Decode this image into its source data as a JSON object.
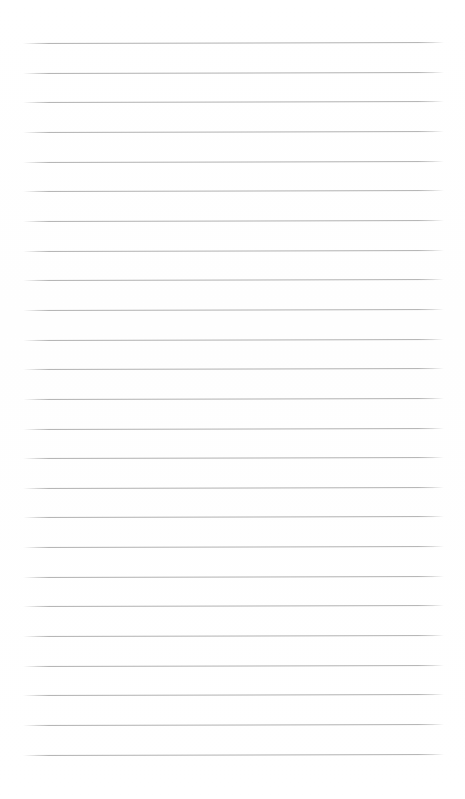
{
  "document": {
    "type": "ruled-notebook-page",
    "title": "Blank Ruled Notebook Page",
    "content_text": "",
    "page_width_px": 465,
    "page_height_px": 799,
    "background_color": "#ffffff",
    "has_text": false,
    "has_images": false,
    "has_handwriting": false
  },
  "ruling": {
    "line_color": "#b2b2b2",
    "line_thickness_px": 1,
    "line_count": 25,
    "line_spacing_px": 29.65,
    "first_line_y_px": 43,
    "last_line_y_px": 755,
    "line_start_x_px": 23,
    "line_end_x_px": 444,
    "line_length_px": 421,
    "slant_deg": -0.12,
    "style": "horizontal-rules-only",
    "has_vertical_margin_rule": false,
    "lines": [
      {
        "index": 1,
        "y": 43.0,
        "x_start": 23,
        "x_end": 444
      },
      {
        "index": 2,
        "y": 72.7,
        "x_start": 23,
        "x_end": 444
      },
      {
        "index": 3,
        "y": 102.3,
        "x_start": 23,
        "x_end": 444
      },
      {
        "index": 4,
        "y": 132.0,
        "x_start": 23,
        "x_end": 444
      },
      {
        "index": 5,
        "y": 161.6,
        "x_start": 23,
        "x_end": 444
      },
      {
        "index": 6,
        "y": 191.3,
        "x_start": 23,
        "x_end": 444
      },
      {
        "index": 7,
        "y": 220.9,
        "x_start": 23,
        "x_end": 444
      },
      {
        "index": 8,
        "y": 250.6,
        "x_start": 23,
        "x_end": 444
      },
      {
        "index": 9,
        "y": 280.2,
        "x_start": 23,
        "x_end": 444
      },
      {
        "index": 10,
        "y": 309.9,
        "x_start": 23,
        "x_end": 444
      },
      {
        "index": 11,
        "y": 339.5,
        "x_start": 23,
        "x_end": 444
      },
      {
        "index": 12,
        "y": 369.2,
        "x_start": 23,
        "x_end": 444
      },
      {
        "index": 13,
        "y": 398.8,
        "x_start": 23,
        "x_end": 444
      },
      {
        "index": 14,
        "y": 428.5,
        "x_start": 23,
        "x_end": 444
      },
      {
        "index": 15,
        "y": 458.1,
        "x_start": 23,
        "x_end": 444
      },
      {
        "index": 16,
        "y": 487.8,
        "x_start": 23,
        "x_end": 444
      },
      {
        "index": 17,
        "y": 517.4,
        "x_start": 23,
        "x_end": 444
      },
      {
        "index": 18,
        "y": 547.1,
        "x_start": 23,
        "x_end": 444
      },
      {
        "index": 19,
        "y": 576.7,
        "x_start": 23,
        "x_end": 444
      },
      {
        "index": 20,
        "y": 606.4,
        "x_start": 23,
        "x_end": 444
      },
      {
        "index": 21,
        "y": 636.0,
        "x_start": 23,
        "x_end": 444
      },
      {
        "index": 22,
        "y": 665.7,
        "x_start": 23,
        "x_end": 444
      },
      {
        "index": 23,
        "y": 695.3,
        "x_start": 23,
        "x_end": 444
      },
      {
        "index": 24,
        "y": 725.0,
        "x_start": 23,
        "x_end": 444
      },
      {
        "index": 25,
        "y": 754.6,
        "x_start": 23,
        "x_end": 444
      }
    ]
  },
  "margins": {
    "top_px": 43,
    "bottom_px": 43,
    "left_px": 23,
    "right_px": 20
  }
}
